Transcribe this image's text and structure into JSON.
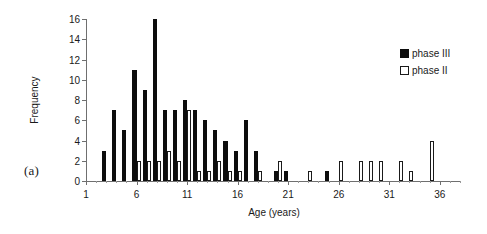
{
  "figure": {
    "panel_label": "(a)"
  },
  "legend": {
    "position": "top-right",
    "entries": [
      {
        "label": "phase III",
        "swatch": "filled-square-icon",
        "color": "#0d0d0d"
      },
      {
        "label": "phase II",
        "swatch": "hollow-square-icon",
        "color": "#ffffff"
      }
    ]
  },
  "chart_data": {
    "type": "bar",
    "title": "",
    "subtitle": "",
    "xlabel": "Age (years)",
    "ylabel": "Frequency",
    "xlim": [
      1,
      38
    ],
    "ylim": [
      0,
      16
    ],
    "ytick_values": [
      0,
      2,
      4,
      6,
      8,
      10,
      12,
      14,
      16
    ],
    "xtick_values": [
      1,
      6,
      11,
      16,
      21,
      26,
      31,
      36
    ],
    "xtick_labels": [
      "1",
      "6",
      "11",
      "16",
      "21",
      "26",
      "31",
      "36"
    ],
    "grid": false,
    "categories": [
      2,
      3,
      4,
      5,
      6,
      7,
      8,
      9,
      10,
      11,
      12,
      13,
      14,
      15,
      16,
      17,
      18,
      19,
      20,
      21,
      22,
      23,
      24,
      25,
      26,
      27,
      28,
      29,
      30,
      31,
      32,
      33,
      34,
      35,
      36,
      37
    ],
    "series": [
      {
        "name": "phase III",
        "color": "#0d0d0d",
        "values": [
          0,
          3,
          7,
          5,
          11,
          9,
          16,
          7,
          7,
          8,
          7,
          6,
          5,
          4,
          3,
          6,
          3,
          0,
          1,
          1,
          0,
          0,
          0,
          1,
          0,
          0,
          0,
          0,
          0,
          0,
          0,
          0,
          0,
          0,
          0,
          0
        ]
      },
      {
        "name": "phase II",
        "color": "#ffffff",
        "values": [
          0,
          0,
          0,
          0,
          2,
          2,
          2,
          3,
          2,
          7,
          1,
          1,
          2,
          1,
          1,
          0,
          1,
          0,
          2,
          0,
          0,
          1,
          0,
          0,
          2,
          0,
          2,
          2,
          2,
          0,
          2,
          1,
          0,
          4,
          0,
          0
        ]
      }
    ]
  }
}
